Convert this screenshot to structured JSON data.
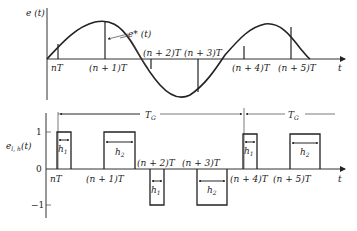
{
  "top_plot": {
    "ylabel": "e (t)",
    "xlabel": "t",
    "curve_label": "e* (t)",
    "ticks": [
      "nT",
      "(n + 1)T",
      "(n + 2)T",
      "(n + 3)T",
      "(n + 4)T",
      "(n + 5)T"
    ]
  },
  "bottom_plot": {
    "ylabel": "e",
    "ylabel_sub": "l, h",
    "ylabel_arg": "(t)",
    "xlabel": "t",
    "y_ticks": [
      "1",
      "0",
      "−1"
    ],
    "ticks": [
      "nT",
      "(n + 1)T",
      "(n + 2)T",
      "(n + 3)T",
      "(n + 4)T",
      "(n + 5)T"
    ],
    "period_label": "T",
    "period_sub": "G",
    "pulses": [
      {
        "label": "h",
        "sub": "1",
        "sign": 1
      },
      {
        "label": "h",
        "sub": "2",
        "sign": 1
      },
      {
        "label": "h",
        "sub": "1",
        "sign": -1
      },
      {
        "label": "h",
        "sub": "2",
        "sign": -1
      },
      {
        "label": "h",
        "sub": "1",
        "sign": 1
      },
      {
        "label": "h",
        "sub": "2",
        "sign": 1
      }
    ]
  }
}
